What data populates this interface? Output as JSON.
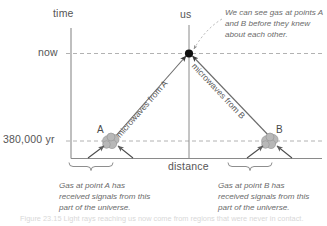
{
  "figure": {
    "type": "cosmology-spacetime-diagram",
    "axes": {
      "y_axis_label": "time",
      "x_axis_label": "distance",
      "y_ticks": [
        {
          "label": "now",
          "value": "now"
        },
        {
          "label": "380,000 yr",
          "value": "380,000 yr"
        }
      ]
    },
    "observer": {
      "label": "us",
      "marker": "observer-dot"
    },
    "points": [
      {
        "id": "A",
        "label": "A"
      },
      {
        "id": "B",
        "label": "B"
      }
    ],
    "rays": [
      {
        "id": "ray-a",
        "label": "microwaves from A"
      },
      {
        "id": "ray-b",
        "label": "microwaves from B"
      }
    ],
    "annotations": [
      {
        "id": "observer-note",
        "text": "We can see gas at points A and B before they knew about each other."
      },
      {
        "id": "brace-note-a",
        "text": "Gas at point A has received signals from this part of the universe."
      },
      {
        "id": "brace-note-b",
        "text": "Gas at point B has received signals from this part of the universe."
      }
    ],
    "colors": {
      "axis": "#8a8a8a",
      "dashed_guide": "#a9a9a9",
      "ray": "#6b6b6b",
      "gas_blob": "#b3b3b3",
      "text": "#5a5a5a",
      "annotation_text": "#6b6b6b",
      "observer_dot": "#111111",
      "background": "#ffffff"
    }
  },
  "caption": {
    "text": "Figure 23.15 Light rays reaching us now come from regions that were never in contact."
  }
}
